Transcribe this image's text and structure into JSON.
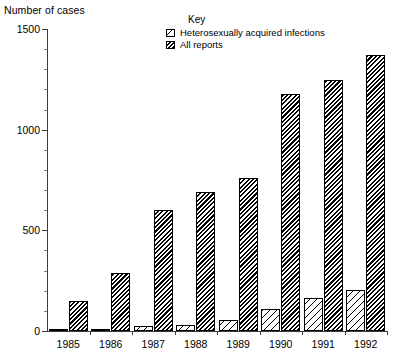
{
  "axis_title": "Number of cases",
  "legend": {
    "title": "Key",
    "items": [
      {
        "label": "Heterosexually acquired infections",
        "swatch": "hatch-light-swatch"
      },
      {
        "label": "All reports",
        "swatch": "hatch-dark-swatch"
      }
    ]
  },
  "y_ticks": [
    "0",
    "500",
    "1000",
    "1500"
  ],
  "colors": {
    "axis": "#3b3b3b",
    "minor_tick": "#7a7a7a",
    "bar_outline": "#000000",
    "bar_fill_light": "#ffffff",
    "bar_fill_dark": "#000000",
    "background": "#ffffff"
  },
  "chart_data": {
    "type": "bar",
    "title": "",
    "xlabel": "",
    "ylabel": "Number of cases",
    "ylim": [
      0,
      1500
    ],
    "ytick_values": [
      0,
      500,
      1000,
      1500
    ],
    "yminor_step": 100,
    "grid": false,
    "legend_position": "top-center",
    "categories": [
      "1985",
      "1986",
      "1987",
      "1988",
      "1989",
      "1990",
      "1991",
      "1992"
    ],
    "series": [
      {
        "name": "Heterosexually acquired infections",
        "values": [
          2,
          3,
          25,
          30,
          55,
          110,
          165,
          205
        ]
      },
      {
        "name": "All reports",
        "values": [
          150,
          290,
          600,
          690,
          760,
          1175,
          1245,
          1370
        ]
      }
    ]
  }
}
